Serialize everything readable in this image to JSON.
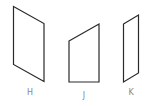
{
  "figure": {
    "shapes": [
      {
        "id": "H",
        "label": "H",
        "kind": "parallelogram"
      },
      {
        "id": "J",
        "label": "J",
        "kind": "trapezoid"
      },
      {
        "id": "K",
        "label": "K",
        "kind": "parallelogram"
      }
    ]
  },
  "colors": {
    "stroke": "#2a2a2a",
    "label": "#8a8a8a",
    "background": "#ffffff"
  }
}
